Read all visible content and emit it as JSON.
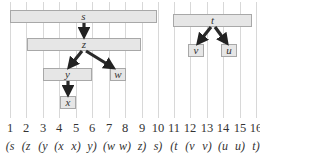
{
  "diagram": {
    "grid_positions": [
      10,
      26,
      43,
      59,
      76,
      92,
      109,
      125,
      142,
      158,
      174,
      190,
      207,
      223,
      240,
      256
    ],
    "nodes": [
      {
        "label": "s",
        "left": 10,
        "right": 157,
        "top": 10
      },
      {
        "label": "z",
        "left": 27,
        "right": 141,
        "top": 38
      },
      {
        "label": "y",
        "left": 43,
        "right": 92,
        "top": 68
      },
      {
        "label": "w",
        "left": 110,
        "right": 126,
        "top": 68
      },
      {
        "label": "x",
        "left": 60,
        "right": 76,
        "top": 96
      },
      {
        "label": "t",
        "left": 173,
        "right": 252,
        "top": 14
      },
      {
        "label": "v",
        "left": 188,
        "right": 204,
        "top": 44
      },
      {
        "label": "u",
        "left": 221,
        "right": 237,
        "top": 44
      }
    ],
    "edges": [
      {
        "from": "s",
        "to": "z"
      },
      {
        "from": "z",
        "to": "y"
      },
      {
        "from": "z",
        "to": "w"
      },
      {
        "from": "y",
        "to": "x"
      },
      {
        "from": "t",
        "to": "v"
      },
      {
        "from": "t",
        "to": "u"
      }
    ],
    "time_labels": [
      "1",
      "2",
      "3",
      "4",
      "5",
      "6",
      "7",
      "8",
      "9",
      "10",
      "11",
      "12",
      "13",
      "14",
      "15",
      "16"
    ],
    "parenthesization": [
      "(s",
      "(z",
      "(y",
      "(x",
      "x)",
      "y)",
      "(w",
      "w)",
      "z)",
      "s)",
      "(t",
      "(v",
      "v)",
      "(u",
      "u)",
      "t)"
    ]
  }
}
